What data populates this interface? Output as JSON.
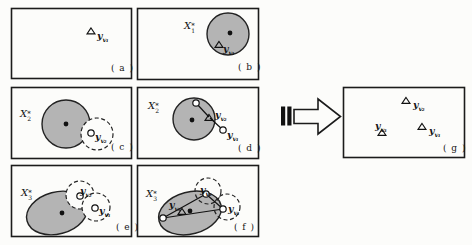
{
  "figure_type": "paper-figure-representative-point-selection",
  "colors": {
    "paper": "#fcfcfa",
    "region_fill": "#b4b4b4",
    "ink": "#1b1b1b"
  },
  "symbols": {
    "x1": {
      "base": "X",
      "sup": "*",
      "sub": "1"
    },
    "x2": {
      "base": "X",
      "sup": "*",
      "sub": "2"
    },
    "x3": {
      "base": "X",
      "sup": "*",
      "sub": "3"
    },
    "yv1": {
      "base": "y",
      "sub": "v₁"
    },
    "yv2": {
      "base": "y",
      "sub": "v₂"
    },
    "yv3": {
      "base": "y",
      "sub": "v₃"
    }
  },
  "panel_tags": {
    "a": "( a )",
    "b": "( b )",
    "c": "( c )",
    "d": "( d )",
    "e": "( e )",
    "f": "( f )",
    "g": "( g )"
  }
}
